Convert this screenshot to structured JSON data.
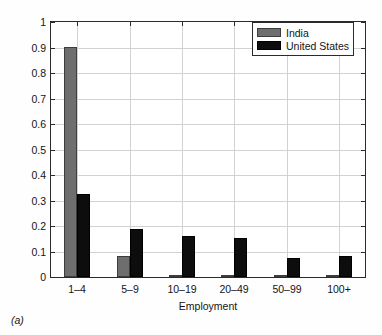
{
  "caption": "(a)",
  "legend": {
    "position": "top-right",
    "entries": [
      {
        "label": "India",
        "color": "#6e6e6e",
        "icon": "legend-swatch-icon"
      },
      {
        "label": "United States",
        "color": "#0d0d0d",
        "icon": "legend-swatch-icon"
      }
    ]
  },
  "chart_data": {
    "type": "bar",
    "title": "",
    "subtitle": "",
    "xlabel": "Employment",
    "ylabel": "",
    "categories": [
      "1–4",
      "5–9",
      "10–19",
      "20–49",
      "50–99",
      "100+"
    ],
    "series": [
      {
        "name": "India",
        "color": "#6e6e6e",
        "values": [
          0.9,
          0.082,
          0.008,
          0.005,
          0.002,
          0.002
        ]
      },
      {
        "name": "United States",
        "color": "#0d0d0d",
        "values": [
          0.325,
          0.19,
          0.16,
          0.152,
          0.073,
          0.083
        ]
      }
    ],
    "ylim": [
      0,
      1
    ],
    "yticks": [
      0,
      0.1,
      0.2,
      0.3,
      0.4,
      0.5,
      0.6,
      0.7,
      0.8,
      0.9,
      1
    ],
    "yticklabels": [
      "0",
      "0.1",
      "0.2",
      "0.3",
      "0.4",
      "0.5",
      "0.6",
      "0.7",
      "0.8",
      "0.9",
      "1"
    ],
    "grid": true,
    "legend_position": "top-right"
  }
}
